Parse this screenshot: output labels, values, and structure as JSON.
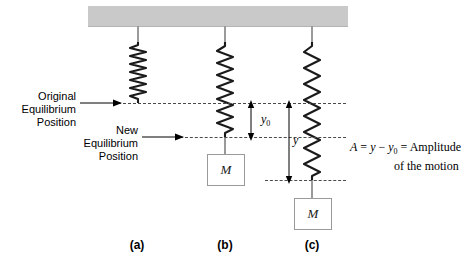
{
  "figure": {
    "type": "physics-diagram",
    "colors": {
      "ceiling": "#c9c9c9",
      "spring": "#1a1a1a",
      "dashed_line": "#4a4a4a",
      "rod": "#9a9a9a",
      "mass_border": "#9a9a9a",
      "text": "#000000"
    }
  },
  "labels": {
    "original_equilibrium": "Original\nEquilibrium\nPosition",
    "original_equilibrium_lines": [
      "Original",
      "Equilibrium",
      "Position"
    ],
    "new_equilibrium_lines": [
      "New",
      "Equilibrium",
      "Position"
    ],
    "y0": "y",
    "y0_sub": "0",
    "y": "y",
    "mass": "M"
  },
  "formula": {
    "line1_a": "A",
    "line1_eq1": " = ",
    "line1_y": "y",
    "line1_minus": " − ",
    "line1_y0": "y",
    "line1_y0_sub": "0",
    "line1_eq2": " = ",
    "line1_amplitude": "Amplitude",
    "line2": "of the motion"
  },
  "panels": [
    {
      "id": "a",
      "label": "(a)",
      "state": "relaxed spring, no mass"
    },
    {
      "id": "b",
      "label": "(b)",
      "state": "mass at new equilibrium"
    },
    {
      "id": "c",
      "label": "(c)",
      "state": "mass displaced, stretched"
    }
  ]
}
